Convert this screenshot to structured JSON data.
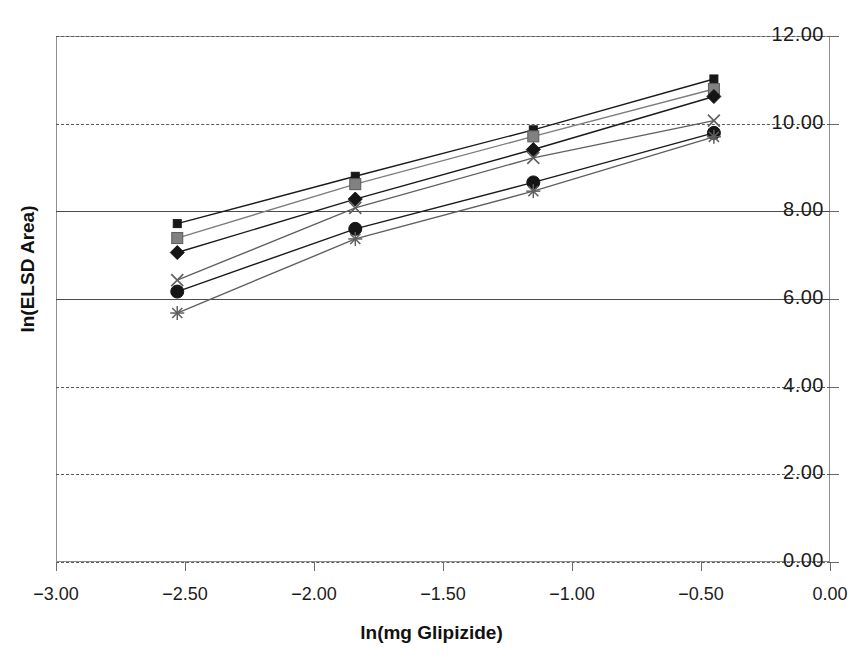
{
  "chart_data": {
    "type": "line",
    "title": "",
    "xlabel": "ln(mg Glipizide)",
    "ylabel": "ln(ELSD Area)",
    "xlim": [
      -3.0,
      0.0
    ],
    "ylim": [
      0.0,
      12.0
    ],
    "xticks": [
      "-3.00",
      "-2.50",
      "-2.00",
      "-1.50",
      "-1.00",
      "-0.50",
      "0.00"
    ],
    "yticks": [
      "0.00",
      "2.00",
      "4.00",
      "6.00",
      "8.00",
      "10.00",
      "12.00"
    ],
    "grid": true,
    "legend": "none",
    "x": [
      -2.53,
      -1.84,
      -1.15,
      -0.45
    ],
    "series": [
      {
        "name": "series-1",
        "marker": "square-dark",
        "color": "#1a1a1a",
        "values": [
          7.72,
          8.8,
          9.86,
          11.02
        ]
      },
      {
        "name": "series-2",
        "marker": "square-gray",
        "color": "#7d7d7d",
        "values": [
          7.39,
          8.62,
          9.71,
          10.79
        ]
      },
      {
        "name": "series-3",
        "marker": "diamond",
        "color": "#1a1a1a",
        "values": [
          7.06,
          8.28,
          9.41,
          10.62
        ]
      },
      {
        "name": "series-4",
        "marker": "cross-x",
        "color": "#5f5f5f",
        "values": [
          6.43,
          8.08,
          9.22,
          10.07
        ]
      },
      {
        "name": "series-5",
        "marker": "circle",
        "color": "#1a1a1a",
        "values": [
          6.17,
          7.6,
          8.66,
          9.79
        ]
      },
      {
        "name": "series-6",
        "marker": "asterisk",
        "color": "#5f5f5f",
        "values": [
          5.68,
          7.37,
          8.46,
          9.7
        ]
      }
    ]
  },
  "axes": {
    "x_title": "ln(mg Glipizide)",
    "y_title": "ln(ELSD Area)"
  }
}
